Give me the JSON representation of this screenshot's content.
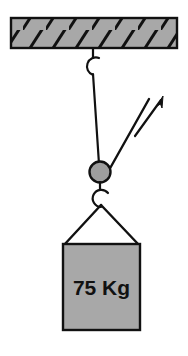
{
  "figure": {
    "background_color": "#ffffff",
    "width": 188,
    "height": 356
  },
  "ceiling": {
    "name": "hatched ceiling beam",
    "fill_color": "#a8a8a8",
    "stroke_color": "#111111",
    "hatch_color": "#111111",
    "hatch_count": 7,
    "x": 11,
    "y": 18,
    "width": 166,
    "height": 30
  },
  "upper_hook": {
    "name": "ceiling hook",
    "stroke_color": "#111111",
    "center_x": 93,
    "center_y": 66,
    "radius": 9
  },
  "rope_vertical": {
    "name": "vertical rope from ceiling hook to pulley",
    "stroke_color": "#111111",
    "x1": 93,
    "y1": 75,
    "x2": 99,
    "y2": 164
  },
  "pulley": {
    "name": "pulley wheel",
    "fill_color": "#9e9e9e",
    "stroke_color": "#111111",
    "center_x": 100,
    "center_y": 172,
    "radius": 10
  },
  "rope_diagonal": {
    "name": "rope over pulley pulled up to the right",
    "stroke_color": "#111111",
    "x1": 104,
    "y1": 178,
    "x2": 148,
    "y2": 100
  },
  "force_arrow": {
    "name": "applied force arrow",
    "stroke_color": "#111111",
    "x1": 136,
    "y1": 134,
    "x2": 163,
    "y2": 97,
    "direction": "up-right"
  },
  "lower_hook": {
    "name": "load hook",
    "stroke_color": "#111111",
    "center_x": 101,
    "center_y": 199,
    "radius": 9
  },
  "sling": {
    "name": "sling ropes to load corners",
    "stroke_color": "#111111",
    "apex_x": 101,
    "apex_y": 206,
    "left_x": 64,
    "left_y": 245,
    "right_x": 139,
    "right_y": 245
  },
  "load_block": {
    "name": "suspended mass block",
    "label": "75 Kg",
    "mass_value": 75,
    "mass_unit": "Kg",
    "fill_color": "#a8a8a8",
    "stroke_color": "#111111",
    "text_color": "#111111",
    "x": 63,
    "y": 244,
    "width": 77,
    "height": 86
  }
}
